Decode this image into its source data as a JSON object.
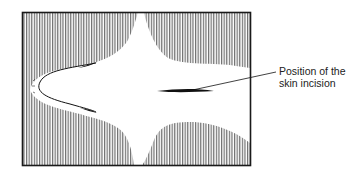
{
  "diagram": {
    "annotation": {
      "line1": "Position of the",
      "line2": "skin incision"
    },
    "colors": {
      "frame": "#1a1a1a",
      "hatch": "#777777",
      "incision": "#111111",
      "text": "#222222"
    }
  }
}
